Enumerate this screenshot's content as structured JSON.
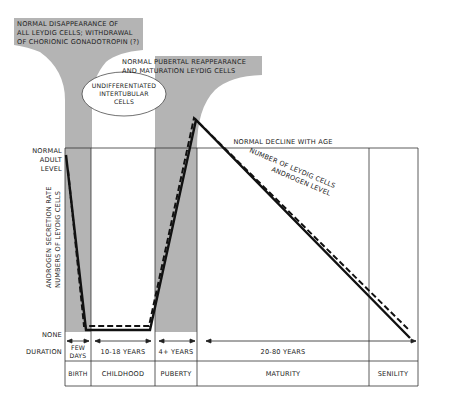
{
  "callouts": {
    "birth": [
      "NORMAL DISAPPEARANCE OF",
      "ALL LEYDIG CELLS; WITHDRAWAL",
      "OF CHORIONIC GONADOTROPIN (?)"
    ],
    "puberty": [
      "NORMAL PUBERTAL REAPPEARANCE",
      "AND MATURATION LEYDIG CELLS"
    ],
    "childhood": [
      "UNDIFFERENTIATED",
      "INTERTUBULAR",
      "CELLS"
    ],
    "maturity": "NORMAL DECLINE WITH AGE"
  },
  "y_axis": {
    "top_label": [
      "NORMAL",
      "ADULT",
      "LEVEL"
    ],
    "bottom_label": "NONE",
    "title_lines": [
      "ANDROGEN SECRETION RATE",
      "NUMBERS OF LEYDIG CELLS"
    ]
  },
  "curve_labels": {
    "androgen": "ANDROGEN LEVEL",
    "leydig": "NUMBER OF LEYDIG CELLS"
  },
  "duration": {
    "row_label": "DURATION",
    "birth": [
      "FEW",
      "DAYS"
    ],
    "childhood": "10-18 YEARS",
    "puberty": "4+ YEARS",
    "maturity": "20-80 YEARS"
  },
  "stages": [
    "BIRTH",
    "CHILDHOOD",
    "PUBERTY",
    "MATURITY",
    "SENILITY"
  ],
  "colors": {
    "shade": "#b4b4b4",
    "line": "#111111",
    "grid": "#333333"
  }
}
